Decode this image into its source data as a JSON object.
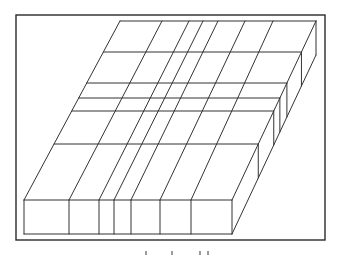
{
  "figure": {
    "type": "oblique-projection slab partitioned into grid",
    "frame": {
      "x": 16,
      "y": 15,
      "width": 309,
      "height": 225
    },
    "colors": {
      "stroke": "#333333",
      "frame": "#2a2a2a",
      "background": "#ffffff"
    },
    "slab": {
      "top_face": {
        "back_left": [
          120,
          21
        ],
        "back_right": [
          316,
          21
        ],
        "front_left": [
          24,
          200
        ],
        "front_right": [
          232,
          200
        ]
      },
      "thickness_px": 34,
      "front_face": {
        "left": 24,
        "right": 232,
        "top": 200,
        "bottom": 234
      },
      "depth_dividers_top_x": [
        162,
        189,
        203,
        218,
        245,
        273
      ],
      "depth_dividers_front_x": [
        69,
        99,
        114,
        131,
        160,
        191
      ],
      "width_dividers_y": [
        52,
        83,
        98,
        111,
        144
      ]
    },
    "caption": {
      "legible": false,
      "marks": 4
    }
  }
}
